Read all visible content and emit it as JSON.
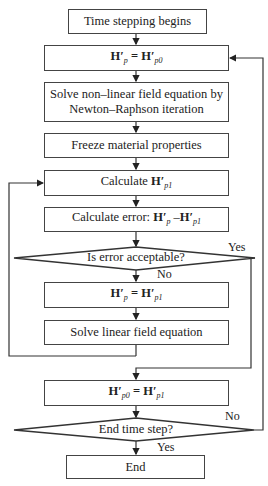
{
  "flowchart": {
    "nodes": {
      "start": {
        "text": "Time stepping begins"
      },
      "init": {
        "lhs": "H′",
        "lhs_sub": "p",
        "eq": " = ",
        "rhs": "H′",
        "rhs_sub": "p0"
      },
      "solve_nonlinear": {
        "line1": "Solve non–linear field equation by",
        "line2": "Newton–Raphson iteration"
      },
      "freeze": {
        "text": "Freeze material properties"
      },
      "calc_h": {
        "prefix": "Calculate ",
        "var": "H′",
        "sub": "p1"
      },
      "calc_error": {
        "prefix": "Calculate error: ",
        "var1": "H′",
        "sub1": "p",
        "minus": " –",
        "var2": "H′",
        "sub2": "p1"
      },
      "decision_error": {
        "text": "Is error acceptable?"
      },
      "update": {
        "lhs": "H′",
        "lhs_sub": "p",
        "eq": " = ",
        "rhs": "H′",
        "rhs_sub": "p1"
      },
      "solve_linear": {
        "text": "Solve linear field equation"
      },
      "store": {
        "lhs": "H′",
        "lhs_sub": "p0",
        "eq": " = ",
        "rhs": "H′",
        "rhs_sub": "p1"
      },
      "decision_end": {
        "text": "End time step?"
      },
      "end": {
        "text": "End"
      }
    },
    "labels": {
      "error_yes": "Yes",
      "error_no": "No",
      "end_no": "No",
      "end_yes": "Yes"
    }
  }
}
